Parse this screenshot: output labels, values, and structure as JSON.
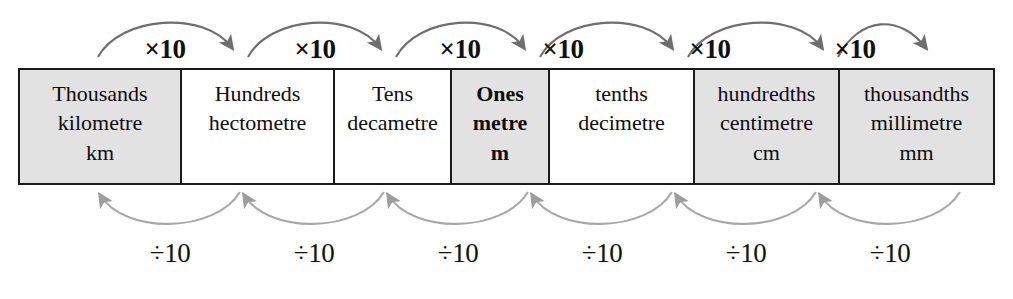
{
  "diagram": {
    "colors": {
      "cell_shaded_fill": "#e2e2e2",
      "cell_plain_fill": "#ffffff",
      "table_border": "#1a1a1a",
      "multiply_arrow": "#6e6e6e",
      "divide_arrow": "#a8a8a8",
      "text": "#0d0d0d",
      "background": "#ffffff"
    },
    "columns": [
      {
        "place_value": "Thousands",
        "unit_name": "kilometre",
        "abbreviation": "km",
        "shaded": true,
        "bold": false
      },
      {
        "place_value": "Hundreds",
        "unit_name": "hectometre",
        "abbreviation": "",
        "shaded": false,
        "bold": false
      },
      {
        "place_value": "Tens",
        "unit_name": "decametre",
        "abbreviation": "",
        "shaded": false,
        "bold": false
      },
      {
        "place_value": "Ones",
        "unit_name": "metre",
        "abbreviation": "m",
        "shaded": true,
        "bold": true
      },
      {
        "place_value": "tenths",
        "unit_name": "decimetre",
        "abbreviation": "",
        "shaded": false,
        "bold": false
      },
      {
        "place_value": "hundredths",
        "unit_name": "centimetre",
        "abbreviation": "cm",
        "shaded": true,
        "bold": false
      },
      {
        "place_value": "thousandths",
        "unit_name": "millimetre",
        "abbreviation": "mm",
        "shaded": true,
        "bold": false
      }
    ],
    "multiply_arrows": {
      "label": "×10",
      "direction": "left-to-right",
      "count": 6,
      "labels": [
        "×10",
        "×10",
        "×10",
        "×10",
        "×10",
        "×10"
      ]
    },
    "divide_arrows": {
      "label": "÷10",
      "direction": "right-to-left",
      "count": 6,
      "labels": [
        "÷10",
        "÷10",
        "÷10",
        "÷10",
        "÷10",
        "÷10"
      ]
    }
  }
}
